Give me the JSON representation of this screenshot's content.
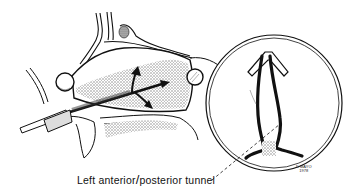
{
  "figure": {
    "caption_part1": "Left anterior",
    "caption_separator": "/",
    "caption_part2": "posterior tunnel",
    "signature_name": "MAYO",
    "signature_year": "1978",
    "signature_initials": "D",
    "colors": {
      "ink": "#111111",
      "stipple": "#9a9a9a",
      "background": "#ffffff"
    }
  }
}
